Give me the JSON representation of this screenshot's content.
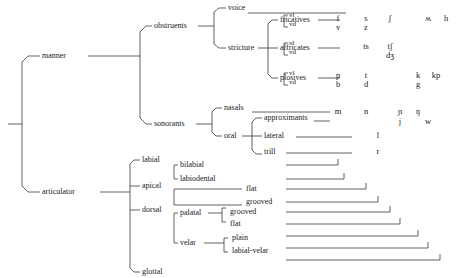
{
  "figure": {
    "type": "tree-diagram",
    "root_label": ""
  },
  "tree": {
    "root_children": [
      {
        "label": "manner"
      },
      {
        "label": "articulator"
      }
    ],
    "manner": {
      "label": "manner",
      "children": [
        {
          "label": "obstruents"
        },
        {
          "label": "sonorants"
        }
      ],
      "obstruents": {
        "label": "obstruents",
        "children": [
          {
            "label": "voice"
          },
          {
            "label": "stricture"
          }
        ],
        "stricture": {
          "label": "stricture",
          "children": [
            {
              "label": "fricatives"
            },
            {
              "label": "affricates"
            },
            {
              "label": "plosives"
            }
          ]
        }
      },
      "sonorants": {
        "label": "sonorants",
        "children": [
          {
            "label": "nasals"
          },
          {
            "label": "oral"
          }
        ],
        "oral": {
          "label": "oral",
          "children": [
            {
              "label": "approximants"
            },
            {
              "label": "lateral"
            },
            {
              "label": "trill"
            }
          ]
        }
      }
    },
    "articulator": {
      "label": "articulator",
      "children": [
        {
          "label": "labial"
        },
        {
          "label": "apical"
        },
        {
          "label": "dorsal"
        },
        {
          "label": "glottal"
        }
      ],
      "labial": {
        "label": "labial",
        "children": [
          {
            "label": "bilabial"
          },
          {
            "label": "labiodental"
          }
        ]
      },
      "apical": {
        "label": "apical",
        "children": [
          {
            "label": "flat"
          },
          {
            "label": "grooved"
          }
        ]
      },
      "dorsal": {
        "label": "dorsal",
        "children": [
          {
            "label": "palatal"
          },
          {
            "label": "velar"
          }
        ],
        "palatal": {
          "label": "palatal",
          "children": [
            {
              "label": "grooved"
            },
            {
              "label": "flat"
            }
          ]
        },
        "velar": {
          "label": "velar",
          "children": [
            {
              "label": "plain"
            },
            {
              "label": "labial-velar"
            }
          ]
        }
      }
    }
  },
  "voicing_labels": {
    "voiceless": "vl",
    "voiced": "vd"
  },
  "phoneme_rows": [
    {
      "row": "fricatives-vl",
      "manner": "fricatives",
      "voicing": "vl",
      "symbols": [
        "f",
        "s",
        "ʃ",
        "ʍ",
        "h"
      ]
    },
    {
      "row": "fricatives-vd",
      "manner": "fricatives",
      "voicing": "vd",
      "symbols": [
        "v",
        "z"
      ]
    },
    {
      "row": "affricates-vl",
      "manner": "affricates",
      "voicing": "vl",
      "symbols": [
        "ts",
        "tʃ"
      ]
    },
    {
      "row": "affricates-vd",
      "manner": "affricates",
      "voicing": "vd",
      "symbols": [
        "dʒ"
      ]
    },
    {
      "row": "plosives-vl",
      "manner": "plosives",
      "voicing": "vl",
      "symbols": [
        "p",
        "t",
        "k",
        "kp"
      ]
    },
    {
      "row": "plosives-vd",
      "manner": "plosives",
      "voicing": "vd",
      "symbols": [
        "b",
        "d",
        "g"
      ]
    },
    {
      "row": "nasals",
      "manner": "nasals",
      "voicing": "",
      "symbols": [
        "m",
        "n",
        "ɲ",
        "ŋ"
      ]
    },
    {
      "row": "approximants",
      "manner": "approximants",
      "voicing": "",
      "symbols": [
        "j",
        "w"
      ]
    },
    {
      "row": "lateral",
      "manner": "lateral",
      "voicing": "",
      "symbols": [
        "l"
      ]
    },
    {
      "row": "trill",
      "manner": "trill",
      "voicing": "",
      "symbols": [
        "r"
      ]
    }
  ],
  "symbol_cells": {
    "fric_vl_f": "f",
    "fric_vl_s": "s",
    "fric_vl_esh": "ʃ",
    "fric_vl_turnedw": "ʍ",
    "fric_vl_h": "h",
    "fric_vd_v": "v",
    "fric_vd_z": "z",
    "affr_vl_ts": "ts",
    "affr_vl_tesh": "tʃ",
    "affr_vd_dezh": "dʒ",
    "plos_vl_p": "p",
    "plos_vl_t": "t",
    "plos_vl_k": "k",
    "plos_vl_kp": "kp",
    "plos_vd_b": "b",
    "plos_vd_d": "d",
    "plos_vd_g": "g",
    "nasal_m": "m",
    "nasal_n": "n",
    "nasal_palatal": "ɲ",
    "nasal_velar": "ŋ",
    "approx_j": "j",
    "approx_w": "w",
    "lateral_l": "l",
    "trill_r": "r"
  },
  "colors": {
    "background": "#ffffff",
    "line": "#3a3a3a",
    "text": "#1a1a1a"
  }
}
